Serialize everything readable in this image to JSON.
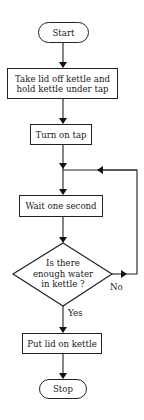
{
  "diagram": {
    "type": "flowchart",
    "nodes": {
      "start": {
        "shape": "terminator",
        "label": "Start"
      },
      "step1": {
        "shape": "process",
        "line1": "Take lid off kettle and",
        "line2": "hold kettle under tap"
      },
      "step2": {
        "shape": "process",
        "label": "Turn on tap"
      },
      "step3": {
        "shape": "process",
        "label": "Wait one second"
      },
      "decision": {
        "shape": "decision",
        "line1": "Is there",
        "line2": "enough water",
        "line3": "in kettle ?"
      },
      "step4": {
        "shape": "process",
        "label": "Put lid on kettle"
      },
      "stop": {
        "shape": "terminator",
        "label": "Stop"
      }
    },
    "edges": {
      "yes_label": "Yes",
      "no_label": "No"
    },
    "colors": {
      "stroke": "#222222",
      "background": "#ffffff"
    }
  }
}
